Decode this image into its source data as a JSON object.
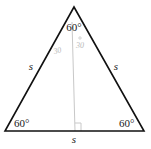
{
  "figure": {
    "sides": {
      "left": "s",
      "right": "s",
      "bottom": "s"
    },
    "angles": {
      "top": "60°",
      "bottom_left": "60°",
      "bottom_right": "60°"
    },
    "annotations": {
      "left_half_angle": "30",
      "right_half_angle": "30"
    },
    "colors": {
      "triangle_stroke": "#111111",
      "altitude_stroke": "#c8c8c8",
      "annotation_text": "#b8b8b8"
    }
  }
}
